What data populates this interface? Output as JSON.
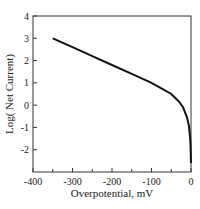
{
  "chart_data": {
    "type": "line",
    "title": "",
    "xlabel": "Overpotential, mV",
    "ylabel": "Log( Net Current)",
    "xlim": [
      -400,
      0
    ],
    "ylim": [
      -3,
      4
    ],
    "x_ticks": [
      -400,
      -300,
      -200,
      -100,
      0
    ],
    "x_tick_labels": [
      "-400",
      "-300",
      "-200",
      "-100",
      "0"
    ],
    "x_minor_ticks": [
      -350,
      -250,
      -150,
      -50
    ],
    "y_ticks": [
      -2,
      -1,
      0,
      1,
      2,
      3,
      4
    ],
    "y_tick_labels": [
      "-2",
      "-1",
      "0",
      "1",
      "2",
      "3",
      "4"
    ],
    "grid": false,
    "legend": null,
    "series": [
      {
        "name": "Log net current",
        "color": "#111111",
        "x": [
          -350,
          -300,
          -250,
          -200,
          -150,
          -100,
          -75,
          -50,
          -30,
          -20,
          -10,
          -5,
          -2,
          -1,
          0
        ],
        "y": [
          3.0,
          2.6,
          2.2,
          1.8,
          1.4,
          1.0,
          0.75,
          0.5,
          0.15,
          -0.1,
          -0.55,
          -0.95,
          -1.5,
          -1.9,
          -2.6
        ]
      }
    ]
  }
}
